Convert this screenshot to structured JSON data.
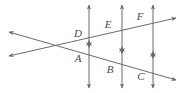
{
  "figure": {
    "kind": "geometry-diagram",
    "width": 184,
    "height": 93,
    "background_color": "#ffffff",
    "stroke_color": "#6b6b6b",
    "label_color": "#4a4a4a",
    "points": [
      {
        "id": "D",
        "label": "D",
        "x": 78,
        "y": 37,
        "on": "upper-transversal-vertical-1"
      },
      {
        "id": "E",
        "label": "E",
        "x": 108,
        "y": 28,
        "on": "upper-transversal-vertical-2"
      },
      {
        "id": "F",
        "label": "F",
        "x": 140,
        "y": 20,
        "on": "upper-transversal-vertical-3"
      },
      {
        "id": "A",
        "label": "A",
        "x": 78,
        "y": 62,
        "on": "lower-transversal-vertical-1"
      },
      {
        "id": "B",
        "label": "B",
        "x": 110,
        "y": 73,
        "on": "lower-transversal-vertical-2"
      },
      {
        "id": "C",
        "label": "C",
        "x": 141,
        "y": 80,
        "on": "lower-transversal-vertical-3"
      }
    ],
    "vertical_lines": [
      {
        "id": "vertical-1",
        "x": 89,
        "y_top": 5,
        "y_bottom": 88
      },
      {
        "id": "vertical-2",
        "x": 122,
        "y_top": 5,
        "y_bottom": 88
      },
      {
        "id": "vertical-3",
        "x": 153,
        "y_top": 5,
        "y_bottom": 88
      }
    ],
    "transversals": [
      {
        "id": "upper-transversal",
        "x1": 9,
        "y1": 56,
        "x2": 176,
        "y2": 18,
        "arrows": "both"
      },
      {
        "id": "lower-transversal",
        "x1": 9,
        "y1": 32,
        "x2": 176,
        "y2": 80,
        "arrows": "both"
      }
    ],
    "mid_markers": [
      {
        "id": "mid-marker-1",
        "x": 89,
        "y": 44
      },
      {
        "id": "mid-marker-2",
        "x": 122,
        "y": 50
      },
      {
        "id": "mid-marker-3",
        "x": 153,
        "y": 55
      }
    ]
  }
}
